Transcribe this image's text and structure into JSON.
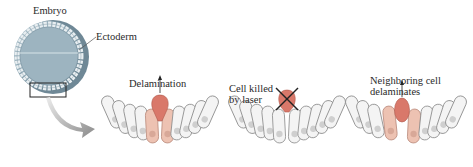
{
  "labels": {
    "embryo": "Embryo",
    "ectoderm": "Ectoderm",
    "panel1": "Delamination",
    "panel2_line1": "Cell killed",
    "panel2_line2": "by laser",
    "panel3_line1": "Neighboring cell",
    "panel3_line2": "delaminates"
  },
  "colors": {
    "sphere": "#8fa9b6",
    "cell_fill": "#f2f2f2",
    "cell_stroke": "#8a8a8a",
    "delaminating_cell": "#d9786a",
    "neighbor_cell": "#edc2b2",
    "arrow_gray": "#9a9a9a"
  }
}
